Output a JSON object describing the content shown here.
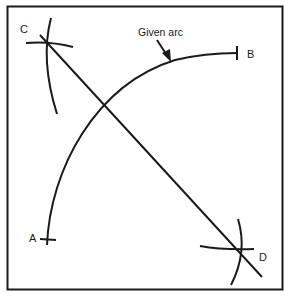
{
  "diagram": {
    "type": "geometric-construction",
    "colors": {
      "ink": "#1a1a1a",
      "background": "#ffffff"
    },
    "labels": {
      "point_a": "A",
      "point_b": "B",
      "point_c": "C",
      "point_d": "D",
      "given_arc": "Given arc"
    },
    "points": {
      "A": [
        47,
        239
      ],
      "B": [
        237,
        53
      ],
      "C": [
        48,
        44
      ],
      "D": [
        238,
        276
      ]
    }
  }
}
